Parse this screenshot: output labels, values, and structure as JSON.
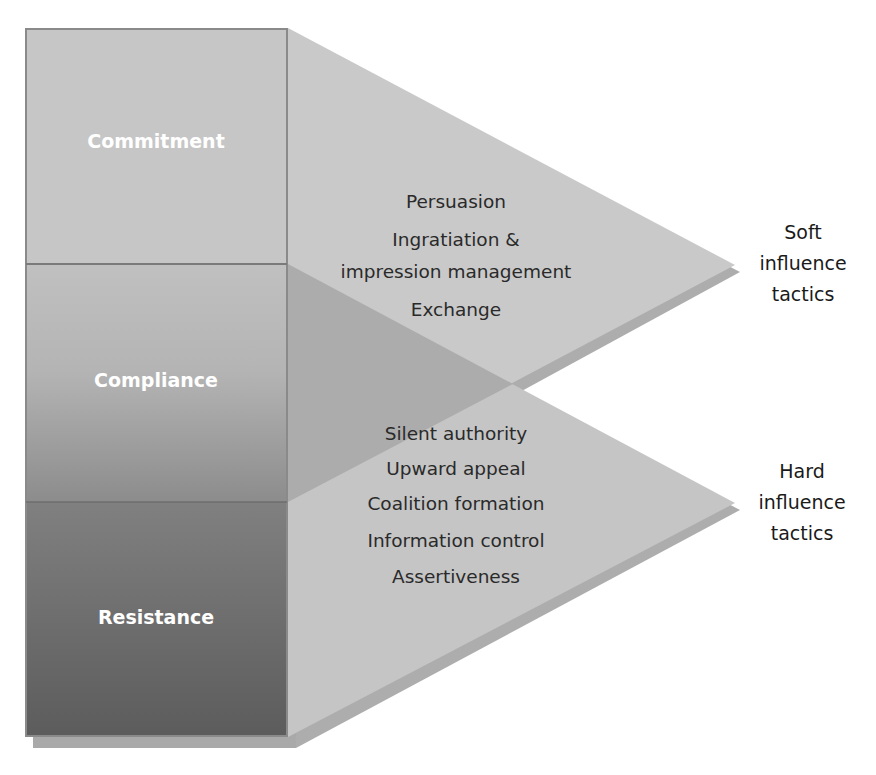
{
  "diagram": {
    "type": "influence-tactics-outcomes",
    "outcomes": [
      {
        "label": "Commitment"
      },
      {
        "label": "Compliance"
      },
      {
        "label": "Resistance"
      }
    ],
    "groups": [
      {
        "name": "soft",
        "label_lines": [
          "Soft",
          "influence",
          "tactics"
        ],
        "tactics": [
          "Persuasion",
          "Ingratiation &",
          "impression management",
          "Exchange"
        ]
      },
      {
        "name": "hard",
        "label_lines": [
          "Hard",
          "influence",
          "tactics"
        ],
        "tactics": [
          "Silent authority",
          "Upward appeal",
          "Coalition formation",
          "Information control",
          "Assertiveness"
        ]
      }
    ],
    "colors": {
      "commitment": "#c6c6c6",
      "compliance_top": "#bdbdbd",
      "compliance_bottom": "#8f8f8f",
      "resistance_top": "#7d7d7d",
      "resistance_bottom": "#5e5e5e",
      "box_border": "#8a8a8a",
      "soft_triangle": "#c8c8c8",
      "hard_triangle": "#c4c4c4",
      "overlap": "#acacac",
      "shadow": "#a8a8a8"
    }
  }
}
